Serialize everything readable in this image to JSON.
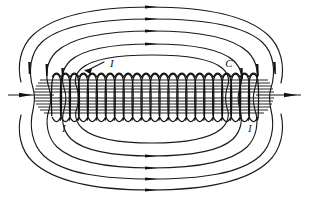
{
  "figure": {
    "background_color": "#ffffff",
    "ink_color": "#1a1a18",
    "width": 309,
    "height": 198
  },
  "labels": {
    "current_top_left": "I",
    "current_bottom_left": "I",
    "current_bottom_right": "I",
    "coil_label": "C"
  },
  "label_positions": {
    "current_top_left": {
      "x": 110,
      "y": 64
    },
    "current_bottom_left": {
      "x": 64,
      "y": 130
    },
    "current_bottom_right": {
      "x": 250,
      "y": 130
    },
    "coil_label": {
      "x": 229,
      "y": 64
    }
  },
  "solenoid": {
    "turn_count": 23,
    "x_start": 52,
    "x_end": 258,
    "top_y": 74,
    "bottom_y": 120,
    "turn_width": 9,
    "core_line_count": 11,
    "core_top_y": 80,
    "core_bottom_y": 112
  },
  "axis": {
    "y": 95,
    "left_start_x": 8,
    "left_end_x": 52,
    "right_start_x": 258,
    "right_end_x": 301,
    "left_arrow_x": 26,
    "right_arrow_x": 296,
    "direction": "right"
  },
  "field_lines": {
    "description": "Nested closed loops encircling the solenoid plus outermost open arcs",
    "loop_count": 4,
    "open_arc_count": 1,
    "top_arrow_x": 152,
    "bottom_arrow_x": 152,
    "top_arrow_y": [
      11,
      22,
      35,
      52
    ],
    "bottom_arrow_y": [
      181,
      170,
      157,
      140
    ],
    "arrow_direction_top": "right",
    "arrow_direction_bottom": "right",
    "side_arrow_direction_left": "down",
    "side_arrow_direction_right": "down"
  },
  "chart_data": {
    "type": "diagram",
    "annotations": [
      "I",
      "C",
      "I",
      "I"
    ]
  }
}
